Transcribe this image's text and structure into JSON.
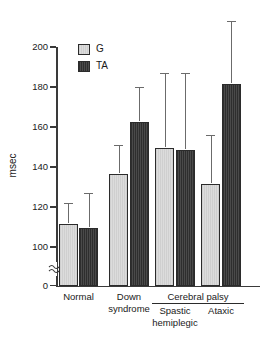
{
  "chart_data": {
    "type": "bar",
    "title": "",
    "xlabel": "",
    "ylabel": "msec",
    "ylim": [
      0,
      200
    ],
    "y_axis_break": true,
    "y_break_between": [
      0,
      100
    ],
    "yticks": [
      0,
      100,
      120,
      140,
      160,
      180,
      200
    ],
    "ytick_labels": [
      "0",
      "100",
      "120",
      "140",
      "160",
      "180",
      "200"
    ],
    "grid": false,
    "legend_position": "upper-left-inside",
    "categories": [
      "Normal",
      "Down syndrome",
      "Spastic hemiplegic",
      "Ataxic"
    ],
    "group_bracket": {
      "label": "Cerebral palsy",
      "spans": [
        "Spastic hemiplegic",
        "Ataxic"
      ]
    },
    "series": [
      {
        "name": "G",
        "color": "#d4d4d4",
        "values": [
          112,
          137,
          150,
          132
        ],
        "errors_upper": [
          10,
          14,
          37,
          24
        ]
      },
      {
        "name": "TA",
        "color": "#3b3b3b",
        "values": [
          110,
          163,
          149,
          182
        ],
        "errors_upper": [
          17,
          17,
          38,
          31
        ]
      }
    ]
  },
  "axis": {
    "y_title": "msec",
    "ticks": [
      {
        "value": 200,
        "label": "200"
      },
      {
        "value": 180,
        "label": "180"
      },
      {
        "value": 160,
        "label": "160"
      },
      {
        "value": 140,
        "label": "140"
      },
      {
        "value": 120,
        "label": "120"
      },
      {
        "value": 100,
        "label": "100"
      },
      {
        "value": 0,
        "label": "0"
      }
    ]
  },
  "legend": {
    "items": [
      {
        "key": "g",
        "label": "G"
      },
      {
        "key": "ta",
        "label": "TA"
      }
    ]
  },
  "x_labels": {
    "normal": "Normal",
    "down_line1": "Down",
    "down_line2": "syndrome",
    "cerebral_palsy": "Cerebral palsy",
    "spastic_line1": "Spastic",
    "spastic_line2": "hemiplegic",
    "ataxic": "Ataxic"
  }
}
